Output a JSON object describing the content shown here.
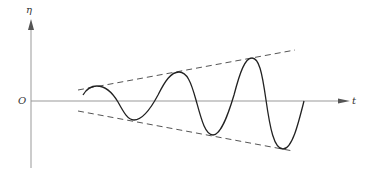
{
  "diagram": {
    "type": "growing oscillation with linear envelope",
    "axes": {
      "vertical_label": "η",
      "horizontal_label": "t",
      "origin_label": "O",
      "origin": [
        31,
        101
      ],
      "vertical_axis": {
        "x": 31,
        "y_top": 20,
        "y_bottom": 168
      },
      "horizontal_axis": {
        "y": 101,
        "x_left": 31,
        "x_right": 350
      }
    },
    "envelope": {
      "style": "dashed",
      "upper": {
        "from": [
          78,
          90
        ],
        "to": [
          295,
          50
        ]
      },
      "lower": {
        "from": [
          78,
          111
        ],
        "to": [
          293,
          151
        ]
      }
    },
    "curve": {
      "style": "solid",
      "start": [
        83,
        95
      ],
      "extrema": [
        {
          "kind": "peak",
          "point": [
            97,
            86
          ]
        },
        {
          "kind": "trough",
          "point": [
            134,
            120
          ]
        },
        {
          "kind": "peak",
          "point": [
            179,
            72
          ]
        },
        {
          "kind": "trough",
          "point": [
            213,
            135
          ]
        },
        {
          "kind": "peak",
          "point": [
            252,
            58
          ]
        },
        {
          "kind": "trough",
          "point": [
            283,
            149
          ]
        }
      ],
      "end": [
        304,
        101
      ]
    },
    "colors": {
      "axis": "#999999",
      "curve": "#222222",
      "envelope": "#555555",
      "label": "#333333"
    }
  }
}
